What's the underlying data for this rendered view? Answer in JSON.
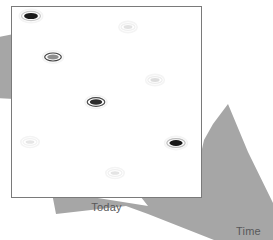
{
  "figure": {
    "title": "",
    "background_color": "#ffffff",
    "arrow": {
      "name": "time-arrow",
      "fill_color": "#a6a6a6",
      "direction": "up-right",
      "description": "large gray arrow sweeping from lower-left behind panel to upper-right"
    },
    "panel": {
      "name": "today-panel",
      "fill_color": "#ffffff",
      "border_color": "#7a7a7a",
      "x": 11,
      "y": 6,
      "width": 191,
      "height": 192
    }
  },
  "labels": {
    "today": "Today",
    "time": "Time",
    "text_color": "#58585a"
  },
  "chart_data": {
    "type": "scatter",
    "title": "",
    "xlabel": "Time",
    "ylabel": "",
    "annotations": [
      "Today",
      "Time"
    ],
    "grid": false,
    "legend": "none",
    "xlim": [
      0,
      1
    ],
    "ylim": [
      0,
      1
    ],
    "marker_shape": "ellipse",
    "series": [
      {
        "name": "items",
        "points": [
          {
            "id": "m1",
            "x": 31,
            "y": 16,
            "rx": 9.5,
            "ry": 4.6,
            "fill": "#1b1b1b",
            "ring": "#c8c8c8",
            "intensity": 1.0
          },
          {
            "id": "m2",
            "x": 128,
            "y": 27,
            "rx": 7.0,
            "ry": 3.4,
            "fill": "#e2e2e2",
            "ring": "#f0f0f0",
            "intensity": 0.12
          },
          {
            "id": "m3",
            "x": 53,
            "y": 57,
            "rx": 8.3,
            "ry": 4.0,
            "fill": "#8e8e8e",
            "ring": "#3f3f3f",
            "intensity": 0.5
          },
          {
            "id": "m4",
            "x": 155,
            "y": 80,
            "rx": 7.2,
            "ry": 3.4,
            "fill": "#dddddd",
            "ring": "#ededed",
            "intensity": 0.15
          },
          {
            "id": "m5",
            "x": 96,
            "y": 102,
            "rx": 8.8,
            "ry": 4.3,
            "fill": "#2b2b2b",
            "ring": "#4a4a4a",
            "intensity": 0.92
          },
          {
            "id": "m6",
            "x": 30,
            "y": 142,
            "rx": 7.0,
            "ry": 3.3,
            "fill": "#e6e6e6",
            "ring": "#f2f2f2",
            "intensity": 0.1
          },
          {
            "id": "m7",
            "x": 176,
            "y": 143,
            "rx": 9.2,
            "ry": 4.4,
            "fill": "#171717",
            "ring": "#bdbdbd",
            "intensity": 1.0
          },
          {
            "id": "m8",
            "x": 115,
            "y": 173,
            "rx": 7.0,
            "ry": 3.3,
            "fill": "#e4e4e4",
            "ring": "#f0f0f0",
            "intensity": 0.11
          }
        ]
      }
    ]
  }
}
